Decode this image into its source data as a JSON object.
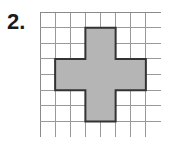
{
  "label": {
    "question_number": "2."
  },
  "colors": {
    "background": "#ffffff",
    "grid_line": "#999999",
    "grid_border": "#8a8a8a",
    "shape_fill": "#b5b5b5",
    "shape_outline": "#333333",
    "label_text": "#1a1a1a"
  },
  "grid": {
    "columns": 8,
    "rows": 8,
    "cell_width": 15.125,
    "cell_height": 15.625,
    "origin_x": 40,
    "origin_y": 12,
    "width": 121,
    "height": 125
  },
  "figure": {
    "name": "plus-cross-polygon",
    "filled_cell_count": 13,
    "filled_cells": [
      [
        3,
        1
      ],
      [
        4,
        1
      ],
      [
        3,
        2
      ],
      [
        4,
        2
      ],
      [
        1,
        3
      ],
      [
        2,
        3
      ],
      [
        3,
        3
      ],
      [
        4,
        3
      ],
      [
        5,
        3
      ],
      [
        6,
        3
      ],
      [
        1,
        4
      ],
      [
        2,
        4
      ],
      [
        3,
        4
      ],
      [
        4,
        4
      ],
      [
        5,
        4
      ],
      [
        6,
        4
      ],
      [
        3,
        5
      ],
      [
        4,
        5
      ],
      [
        3,
        6
      ],
      [
        4,
        6
      ]
    ],
    "outline_points_cells": "3,1 5,1 5,3 7,3 7,5 5,5 5,7 3,7 3,5 1,5 1,3 3,3",
    "vertical_bar": {
      "col_start": 3,
      "col_span": 2,
      "row_start": 1,
      "row_span": 6
    },
    "horizontal_bar": {
      "col_start": 1,
      "col_span": 6,
      "row_start": 3,
      "row_span": 2
    }
  }
}
